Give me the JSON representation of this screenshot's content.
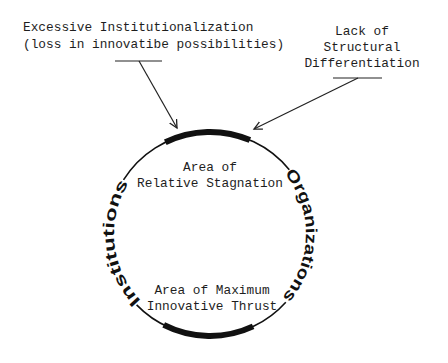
{
  "diagram": {
    "annotations": {
      "left": {
        "line1": "Excessive Institutionalization",
        "line2": "(loss in innovatibe possibilities)"
      },
      "right": {
        "line1": "Lack of",
        "line2": "Structural",
        "line3": "Differentiation"
      }
    },
    "circle": {
      "left_label": "Institutions",
      "right_label": "Organizations",
      "top_area": {
        "line1": "Area of",
        "line2": "Relative Stagnation"
      },
      "bottom_area": {
        "line1": "Area of Maximum",
        "line2": "Innovative Thrust"
      }
    },
    "colors": {
      "ink": "#111111",
      "background": "#ffffff"
    }
  }
}
